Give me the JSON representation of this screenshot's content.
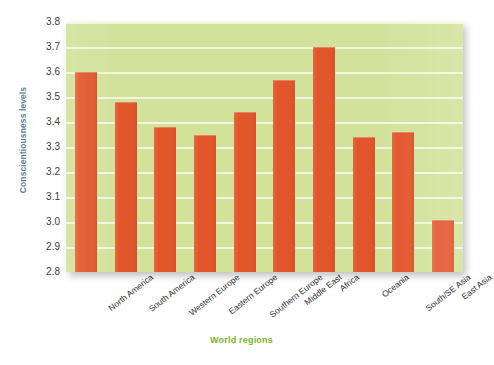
{
  "chart_data": {
    "type": "bar",
    "title": "",
    "xlabel": "World regions",
    "ylabel": "Conscientiousness levels",
    "categories": [
      "North America",
      "South America",
      "Western Europe",
      "Eastern Europe",
      "Southern Europe",
      "Middle East",
      "Africa",
      "Oceania",
      "South/SE Asia",
      "East Asia"
    ],
    "values": [
      3.6,
      3.48,
      3.38,
      3.35,
      3.44,
      3.57,
      3.7,
      3.34,
      3.36,
      3.01
    ],
    "ylim": [
      2.8,
      3.8
    ],
    "ytick_labels": [
      "3.8",
      "3.7",
      "3.6",
      "3.5",
      "3.4",
      "3.3",
      "3.2",
      "3.1",
      "3.0",
      "2.9",
      "2.8"
    ],
    "ytick_values": [
      3.8,
      3.7,
      3.6,
      3.5,
      3.4,
      3.3,
      3.2,
      3.1,
      3.0,
      2.9,
      2.8
    ],
    "grid": true,
    "legend": "none",
    "colors": {
      "bar": "#e2562c",
      "plot_background": "#d3e29b",
      "gridline": "#f4f7e2",
      "ylabel_text": "#5b7f96",
      "xlabel_text": "#76b82a",
      "tick_text": "#3c3c3c",
      "figure_background": "#ffffff"
    }
  }
}
